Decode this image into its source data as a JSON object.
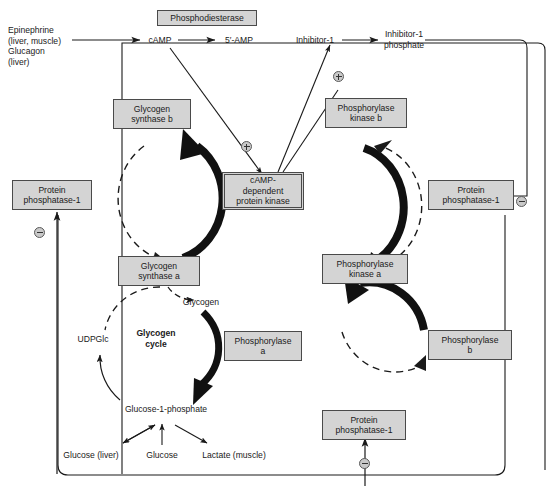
{
  "diagram": {
    "colors": {
      "box_fill": "#d4d4d4",
      "box_stroke": "#4a4a4a",
      "line": "#1a1a1a",
      "background": "#ffffff"
    },
    "boxes": [
      {
        "id": "phosphodiesterase",
        "label": "Phosphodiesterase"
      },
      {
        "id": "glycogen-synthase-b",
        "label": "Glycogen\nsynthase b"
      },
      {
        "id": "phosphorylase-kinase-b",
        "label": "Phosphorylase\nkinase b"
      },
      {
        "id": "protein-phosphatase-1-left",
        "label": "Protein\nphosphatase-1"
      },
      {
        "id": "camp-dependent-protein-kinase",
        "label": "cAMP-\ndependent\nprotein kinase"
      },
      {
        "id": "protein-phosphatase-1-right",
        "label": "Protein\nphosphatase-1"
      },
      {
        "id": "glycogen-synthase-a",
        "label": "Glycogen\nsynthase a"
      },
      {
        "id": "phosphorylase-kinase-a",
        "label": "Phosphorylase\nkinase a"
      },
      {
        "id": "phosphorylase-a",
        "label": "Phosphorylase\na"
      },
      {
        "id": "phosphorylase-b",
        "label": "Phosphorylase\nb"
      },
      {
        "id": "protein-phosphatase-1-bottom",
        "label": "Protein\nphosphatase-1"
      }
    ],
    "labels": [
      {
        "id": "hormones",
        "label": "Epinephrine\n(liver, muscle)\nGlucagon\n(liver)"
      },
      {
        "id": "camp",
        "label": "cAMP"
      },
      {
        "id": "5-amp",
        "label": "5′-AMP"
      },
      {
        "id": "inhibitor-1",
        "label": "Inhibitor-1"
      },
      {
        "id": "inhibitor-1-phosphate",
        "label": "Inhibitor-1\nphosphate"
      },
      {
        "id": "glycogen",
        "label": "Glycogen"
      },
      {
        "id": "udpglc",
        "label": "UDPGlc"
      },
      {
        "id": "glycogen-cycle",
        "label": "Glycogen\ncycle"
      },
      {
        "id": "glucose-1-phosphate",
        "label": "Glucose-1-phosphate"
      },
      {
        "id": "glucose-liver",
        "label": "Glucose (liver)"
      },
      {
        "id": "glucose",
        "label": "Glucose"
      },
      {
        "id": "lactate-muscle",
        "label": "Lactate (muscle)"
      }
    ],
    "signs": [
      {
        "id": "plus-camp-kinase",
        "symbol": "⊕",
        "meaning": "activation"
      },
      {
        "id": "plus-inhibitor-1",
        "symbol": "⊕",
        "meaning": "activation"
      },
      {
        "id": "minus-protein-phosphatase-left",
        "symbol": "⊖",
        "meaning": "inhibition"
      },
      {
        "id": "minus-protein-phosphatase-right",
        "symbol": "⊖",
        "meaning": "inhibition"
      },
      {
        "id": "minus-protein-phosphatase-bottom",
        "symbol": "⊖",
        "meaning": "inhibition"
      }
    ]
  }
}
